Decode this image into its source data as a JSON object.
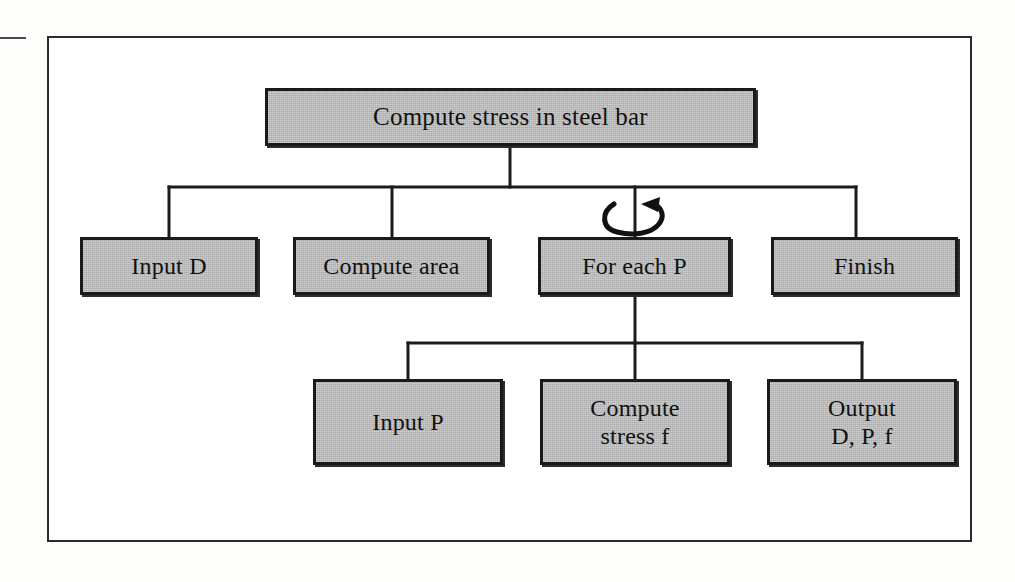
{
  "figure": {
    "type": "structure-chart",
    "title_box": "Compute stress in steel bar",
    "style": {
      "box_fill": "#bcbcbc",
      "box_border": "#1a1a1a",
      "connector_color": "#1c1c1c",
      "frame_border": "#2b2b2b",
      "page_background": "#fdfdfc"
    },
    "annotations": {
      "loop_symbol": "circular-arrow-loop",
      "loop_on_node": "For each P"
    },
    "levels": [
      {
        "level": 1,
        "nodes": [
          {
            "id": "root",
            "label": "Compute stress in steel bar",
            "lines": [
              "Compute stress in steel bar"
            ]
          }
        ]
      },
      {
        "level": 2,
        "nodes": [
          {
            "id": "input-d",
            "label": "Input D",
            "lines": [
              "Input D"
            ]
          },
          {
            "id": "area",
            "label": "Compute area",
            "lines": [
              "Compute area"
            ]
          },
          {
            "id": "foreach",
            "label": "For each P",
            "lines": [
              "For each P"
            ],
            "loop": true
          },
          {
            "id": "finish",
            "label": "Finish",
            "lines": [
              "Finish"
            ]
          }
        ]
      },
      {
        "level": 3,
        "parent": "foreach",
        "nodes": [
          {
            "id": "input-p",
            "label": "Input P",
            "lines": [
              "Input P"
            ]
          },
          {
            "id": "stress",
            "label": "Compute stress f",
            "lines": [
              "Compute",
              "stress f"
            ]
          },
          {
            "id": "output",
            "label": "Output D, P, f",
            "lines": [
              "Output",
              "D, P, f"
            ]
          }
        ]
      }
    ],
    "text": {
      "root": "Compute stress in steel bar",
      "input_d": "Input D",
      "compute_area": "Compute area",
      "for_each_p": "For each P",
      "finish": "Finish",
      "input_p": "Input P",
      "stress_line1": "Compute",
      "stress_line2": "stress f",
      "output_line1": "Output",
      "output_line2": "D, P, f"
    }
  }
}
